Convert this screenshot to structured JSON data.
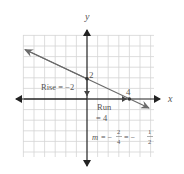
{
  "diagram": {
    "type": "coordinate-graph",
    "axes": {
      "x_label": "x",
      "y_label": "y"
    },
    "grid": {
      "x_range": [
        -6,
        6
      ],
      "y_range": [
        -5,
        6
      ],
      "step": 1
    },
    "line": {
      "points": [
        [
          0,
          2
        ],
        [
          4,
          0
        ]
      ],
      "slope": -0.5,
      "y_intercept": 2,
      "x_intercept": 4
    },
    "labels": {
      "y_intercept_label": "2",
      "x_intercept_label": "4",
      "rise": "Rise = −2",
      "run_line1": "Run",
      "run_line2": "= 4",
      "slope_prefix": "m = −",
      "slope_frac1_num": "2",
      "slope_frac1_den": "4",
      "slope_mid": "= −",
      "slope_frac2_num": "1",
      "slope_frac2_den": "2"
    },
    "colors": {
      "grid": "#d4d4d4",
      "axis": "#222222",
      "line": "#6a6a6a",
      "text": "#555555"
    }
  }
}
